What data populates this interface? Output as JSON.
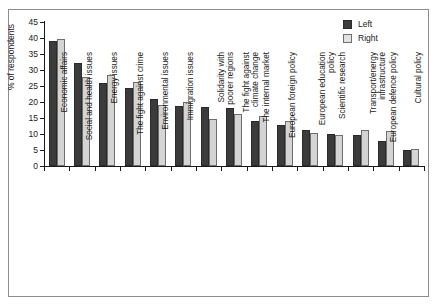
{
  "chart_data": {
    "type": "bar",
    "title": "",
    "xlabel": "",
    "ylabel": "% of respondents",
    "ylim": [
      0,
      45
    ],
    "yticks": [
      0,
      5,
      10,
      15,
      20,
      25,
      30,
      35,
      40,
      45
    ],
    "grid": false,
    "legend_position": "top-right",
    "categories": [
      "Economic affairs",
      "Social and health issues",
      "Energy issues",
      "The fight against crime",
      "Environmental issues",
      "Immigration issues",
      "Solidarity with poorer regions",
      "The fight against climate change",
      "The internal market",
      "European foreign policy",
      "European education policy",
      "Scientific research",
      "Transport/energy infrastructure",
      "European defence policy",
      "Cultural policy"
    ],
    "category_lines": [
      [
        "Economic affairs"
      ],
      [
        "Social and health issues"
      ],
      [
        "Energy issues"
      ],
      [
        "The fight against crime"
      ],
      [
        "Environmental issues"
      ],
      [
        "Immigration issues"
      ],
      [
        "Solidarity with",
        "poorer regions"
      ],
      [
        "The fight against",
        "climate change"
      ],
      [
        "The internal market"
      ],
      [
        "European foreign policy"
      ],
      [
        "European education",
        "policy"
      ],
      [
        "Scientific research"
      ],
      [
        "Transport/energy",
        "infrastructure"
      ],
      [
        "European defence policy"
      ],
      [
        "Cultural policy"
      ]
    ],
    "series": [
      {
        "name": "Left",
        "color": "#3b3b3b",
        "values": [
          39.0,
          32.3,
          25.9,
          24.3,
          20.9,
          18.6,
          18.4,
          18.2,
          14.1,
          12.9,
          11.1,
          9.9,
          9.7,
          7.8,
          5.0
        ]
      },
      {
        "name": "Right",
        "color": "#d4d4d4",
        "values": [
          39.6,
          27.7,
          28.4,
          26.2,
          19.2,
          19.9,
          14.6,
          16.4,
          15.7,
          14.2,
          10.4,
          9.7,
          11.1,
          10.8,
          5.4
        ]
      }
    ]
  },
  "legend": {
    "items": [
      {
        "label": "Left"
      },
      {
        "label": "Right"
      }
    ]
  }
}
